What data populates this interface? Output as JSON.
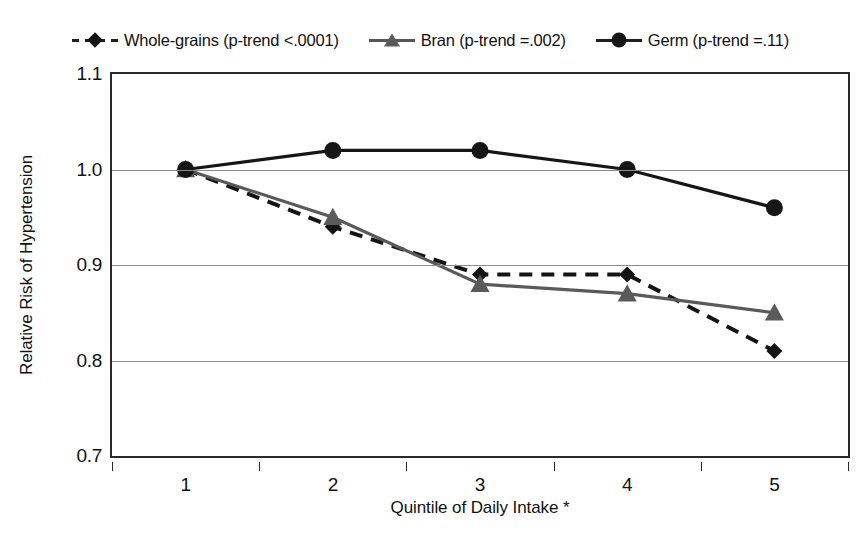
{
  "chart_data": {
    "type": "line",
    "title": "",
    "xlabel": "Quintile of Daily Intake *",
    "ylabel": "Relative Risk of Hypertension",
    "categories": [
      "1",
      "2",
      "3",
      "4",
      "5"
    ],
    "x": [
      1,
      2,
      3,
      4,
      5
    ],
    "ylim": [
      0.7,
      1.1
    ],
    "yticks": [
      "0.7",
      "0.8",
      "0.9",
      "1.0",
      "1.1"
    ],
    "ytick_values": [
      0.7,
      0.8,
      0.9,
      1.0,
      1.1
    ],
    "grid": "horizontal",
    "legend_position": "top",
    "series": [
      {
        "name": "Whole-grains (p-trend <.0001)",
        "short_name": "Whole-grains",
        "p_trend": "<.0001",
        "marker": "diamond",
        "linestyle": "dashed",
        "color": "#141414",
        "values": [
          1.0,
          0.94,
          0.89,
          0.89,
          0.81
        ]
      },
      {
        "name": "Bran (p-trend =.002)",
        "short_name": "Bran",
        "p_trend": "=.002",
        "marker": "triangle",
        "linestyle": "solid",
        "color": "#5a5a5a",
        "values": [
          1.0,
          0.95,
          0.88,
          0.87,
          0.85
        ]
      },
      {
        "name": "Germ (p-trend =.11)",
        "short_name": "Germ",
        "p_trend": "=.11",
        "marker": "circle",
        "linestyle": "solid",
        "color": "#161616",
        "values": [
          1.0,
          1.02,
          1.02,
          1.0,
          0.96
        ]
      }
    ]
  },
  "legend": {
    "entries": [
      {
        "label": "Whole-grains (p-trend <.0001)",
        "marker": "diamond",
        "line": "dashed-dark"
      },
      {
        "label": "Bran (p-trend =.002)",
        "marker": "triangle",
        "line": "solid-gray"
      },
      {
        "label": "Germ (p-trend =.11)",
        "marker": "circle",
        "line": "solid-dark"
      }
    ]
  },
  "axes": {
    "y_title": "Relative Risk of Hypertension",
    "x_title": "Quintile of Daily Intake *"
  }
}
